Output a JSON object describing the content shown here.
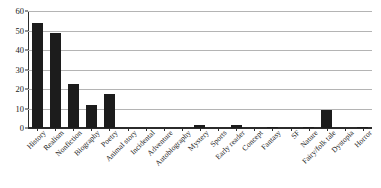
{
  "chart_data": {
    "type": "bar",
    "title": "",
    "xlabel": "",
    "ylabel": "",
    "ylim": [
      0,
      60
    ],
    "yticks": [
      0,
      10,
      20,
      30,
      40,
      50,
      60
    ],
    "grid": true,
    "legend": false,
    "bar_color": "#1c1c1c",
    "gridline_color": "#b4b4b4",
    "axis_color": "#2b2b2b",
    "categories": [
      "History",
      "Realism",
      "Nonfiction",
      "Biography",
      "Poetry",
      "Animal story",
      "Incidental",
      "Adventure",
      "Autobiography",
      "Mystery",
      "Sports",
      "Early reader",
      "Concept",
      "Fantasy",
      "SF",
      "Nature",
      "Fairy/folk tale",
      "Dystopia",
      "Horror"
    ],
    "values": [
      54,
      48.5,
      22.5,
      12,
      17.5,
      0,
      0,
      0,
      0,
      1.5,
      0,
      1.5,
      0,
      0.5,
      0,
      0.5,
      9,
      0,
      0.5
    ]
  }
}
